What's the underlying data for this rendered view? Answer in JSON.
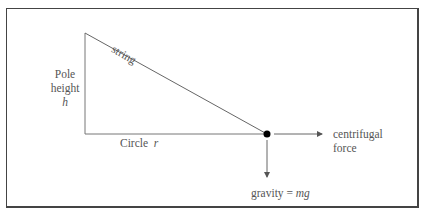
{
  "diagram": {
    "labels": {
      "string": "string",
      "pole_line1": "Pole",
      "pole_line2": "height",
      "pole_var": "h",
      "circle": "Circle",
      "circle_var": "r",
      "centrifugal_line1": "centrifugal",
      "centrifugal_line2": "force",
      "gravity_prefix": "gravity = ",
      "gravity_var": "mg"
    },
    "colors": {
      "line": "#666666",
      "border": "#444444",
      "mass": "#000000"
    }
  }
}
